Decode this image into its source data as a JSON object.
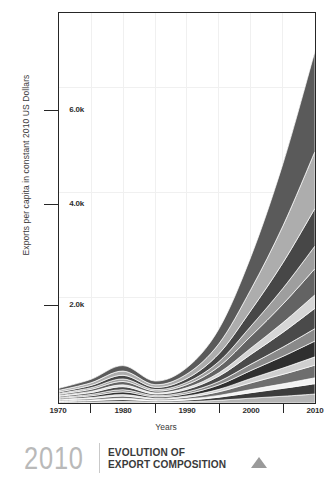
{
  "footer": {
    "year": "2010",
    "title_line1": "EVOLUTION OF",
    "title_line2": "EXPORT COMPOSITION",
    "marker": "triangle-up"
  },
  "chart_data": {
    "type": "area",
    "stacked": true,
    "title": "EVOLUTION OF EXPORT COMPOSITION",
    "subtitle": "2010",
    "xlabel": "Years",
    "ylabel": "Exports per capita in constant 2010 US Dollars",
    "xlim": [
      1970,
      2010
    ],
    "ylim": [
      0,
      7400
    ],
    "xticks": [
      1970,
      1980,
      1990,
      2000,
      2010
    ],
    "xticklabels": [
      "1970",
      "1980",
      "1990",
      "2000",
      "2010"
    ],
    "xminorticks": [
      1975,
      1985,
      1995,
      2005
    ],
    "yticks": [
      2000,
      4000,
      6000
    ],
    "yticklabels": [
      "2.0k",
      "4.0k",
      "6.0k"
    ],
    "grid": true,
    "legend": "none",
    "x": [
      1970,
      1975,
      1980,
      1985,
      1990,
      1995,
      2000,
      2005,
      2010
    ],
    "series": [
      {
        "name": "band-01",
        "color": "#b4b4b4",
        "values": [
          14,
          20,
          30,
          18,
          26,
          52,
          92,
          128,
          170
        ]
      },
      {
        "name": "band-02",
        "color": "#3c3c3c",
        "values": [
          16,
          24,
          36,
          20,
          30,
          58,
          104,
          150,
          196
        ]
      },
      {
        "name": "band-03",
        "color": "#f2f2f2",
        "values": [
          10,
          14,
          22,
          12,
          18,
          34,
          60,
          86,
          112
        ]
      },
      {
        "name": "band-04",
        "color": "#6e6e6e",
        "values": [
          18,
          28,
          44,
          24,
          36,
          70,
          126,
          180,
          240
        ]
      },
      {
        "name": "band-05",
        "color": "#cfcfcf",
        "values": [
          12,
          18,
          28,
          16,
          24,
          46,
          84,
          120,
          158
        ]
      },
      {
        "name": "band-06",
        "color": "#2f2f2f",
        "values": [
          20,
          32,
          52,
          28,
          42,
          84,
          152,
          222,
          300
        ]
      },
      {
        "name": "band-07",
        "color": "#8a8a8a",
        "values": [
          16,
          26,
          40,
          22,
          34,
          66,
          120,
          176,
          236
        ]
      },
      {
        "name": "band-08",
        "color": "#4a4a4a",
        "values": [
          22,
          36,
          58,
          32,
          50,
          100,
          186,
          280,
          386
        ]
      },
      {
        "name": "band-09",
        "color": "#d6d6d6",
        "values": [
          14,
          22,
          34,
          20,
          32,
          64,
          120,
          184,
          256
        ]
      },
      {
        "name": "band-10",
        "color": "#636363",
        "values": [
          24,
          40,
          64,
          36,
          58,
          118,
          226,
          352,
          496
        ]
      },
      {
        "name": "band-11",
        "color": "#9e9e9e",
        "values": [
          18,
          30,
          48,
          28,
          46,
          96,
          190,
          300,
          430
        ]
      },
      {
        "name": "band-12",
        "color": "#474747",
        "values": [
          26,
          44,
          70,
          42,
          70,
          150,
          300,
          486,
          714
        ]
      },
      {
        "name": "band-13",
        "color": "#adadad",
        "values": [
          30,
          50,
          80,
          50,
          86,
          190,
          400,
          700,
          1080
        ]
      },
      {
        "name": "band-14",
        "color": "#5a5a5a",
        "values": [
          40,
          66,
          104,
          68,
          120,
          280,
          620,
          1180,
          1900
        ]
      }
    ],
    "totals": [
      280,
      450,
      710,
      416,
      672,
      1408,
      2780,
      4544,
      6674
    ]
  }
}
